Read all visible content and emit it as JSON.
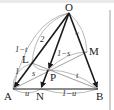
{
  "figure": {
    "colors": {
      "main_line": "#1a1a1a",
      "thin_line": "#777777",
      "arc": "#888888",
      "text": "#222222",
      "frame_rule": "#cfcfcf"
    },
    "points": {
      "O": {
        "label": "O",
        "x": 69,
        "y": 13
      },
      "A": {
        "label": "A",
        "x": 13,
        "y": 89
      },
      "B": {
        "label": "B",
        "x": 98,
        "y": 89
      },
      "N": {
        "label": "N",
        "x": 41,
        "y": 89
      },
      "M": {
        "label": "M",
        "x": 87,
        "y": 52
      },
      "L": {
        "label": "L",
        "x": 32,
        "y": 63
      },
      "P": {
        "label": "P",
        "x": 48,
        "y": 70
      }
    },
    "ratio_labels": {
      "OA_upper": "2",
      "OL": "1−t",
      "LA": "1",
      "LP": "s",
      "PM": "1−s",
      "PB": "t",
      "AN": "u",
      "NB": "1−u"
    },
    "vectors": [
      {
        "from": "O",
        "to": "A"
      },
      {
        "from": "O",
        "to": "B"
      },
      {
        "from": "O",
        "to": "N"
      }
    ],
    "segments": [
      {
        "from": "A",
        "to": "B"
      },
      {
        "from": "L",
        "to": "B"
      },
      {
        "from": "A",
        "to": "M"
      }
    ]
  }
}
